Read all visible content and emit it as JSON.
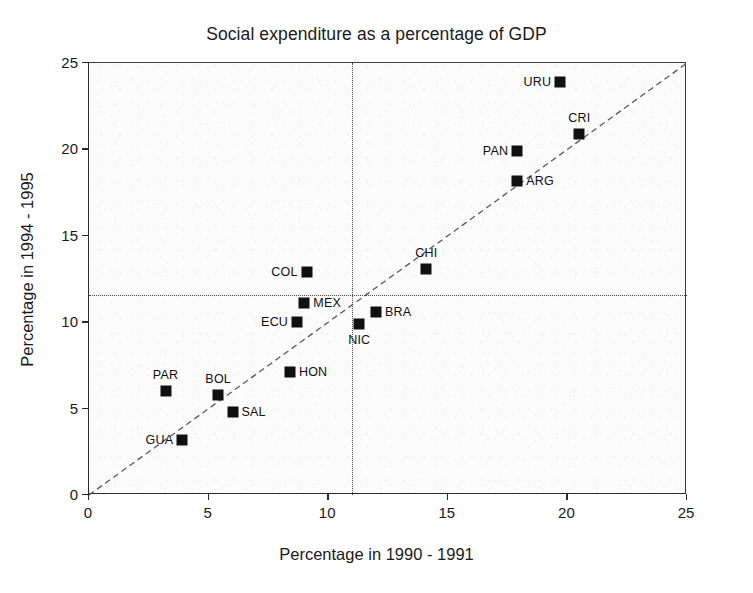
{
  "chart_data": {
    "type": "scatter",
    "title": "Social expenditure as a percentage of GDP",
    "xlabel": "Percentage in 1990 - 1991",
    "ylabel": "Percentage in 1994 - 1995",
    "xlim": [
      0,
      25
    ],
    "ylim": [
      0,
      25
    ],
    "xticks": [
      "0",
      "5",
      "10",
      "15",
      "20",
      "25"
    ],
    "yticks": [
      "0",
      "5",
      "10",
      "15",
      "20",
      "25"
    ],
    "xtick_values": [
      0,
      5,
      10,
      15,
      20,
      25
    ],
    "ytick_values": [
      0,
      5,
      10,
      15,
      20,
      25
    ],
    "grid": false,
    "legend": "none",
    "reference_lines": [
      {
        "name": "identity-line",
        "type": "diagonal",
        "from": [
          0,
          0
        ],
        "to": [
          25,
          25
        ],
        "style": "dashed"
      },
      {
        "name": "mean-x-line",
        "type": "vertical",
        "value": 11.0,
        "style": "dotted"
      },
      {
        "name": "mean-y-line",
        "type": "horizontal",
        "value": 11.6,
        "style": "dotted"
      }
    ],
    "points": [
      {
        "label": "URU",
        "x": 19.7,
        "y": 23.9,
        "label_pos": "left"
      },
      {
        "label": "CRI",
        "x": 20.5,
        "y": 20.9,
        "label_pos": "above"
      },
      {
        "label": "PAN",
        "x": 17.9,
        "y": 19.9,
        "label_pos": "left"
      },
      {
        "label": "ARG",
        "x": 17.9,
        "y": 18.2,
        "label_pos": "right"
      },
      {
        "label": "CHI",
        "x": 14.1,
        "y": 13.1,
        "label_pos": "above"
      },
      {
        "label": "COL",
        "x": 9.1,
        "y": 12.9,
        "label_pos": "left"
      },
      {
        "label": "MEX",
        "x": 9.0,
        "y": 11.1,
        "label_pos": "right"
      },
      {
        "label": "ECU",
        "x": 8.7,
        "y": 10.0,
        "label_pos": "left"
      },
      {
        "label": "BRA",
        "x": 12.0,
        "y": 10.6,
        "label_pos": "right"
      },
      {
        "label": "NIC",
        "x": 11.3,
        "y": 9.9,
        "label_pos": "below"
      },
      {
        "label": "HON",
        "x": 8.4,
        "y": 7.1,
        "label_pos": "right"
      },
      {
        "label": "PAR",
        "x": 3.2,
        "y": 6.0,
        "label_pos": "above"
      },
      {
        "label": "BOL",
        "x": 5.4,
        "y": 5.8,
        "label_pos": "above"
      },
      {
        "label": "SAL",
        "x": 6.0,
        "y": 4.8,
        "label_pos": "right"
      },
      {
        "label": "GUA",
        "x": 3.9,
        "y": 3.2,
        "label_pos": "left"
      }
    ]
  },
  "colors": {
    "marker": "#101010",
    "axis": "#2b2b2b",
    "reference": "#4a4a4a",
    "background": "#fbfbfb"
  }
}
